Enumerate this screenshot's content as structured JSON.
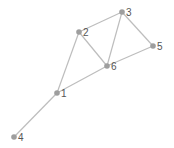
{
  "graph": {
    "colors": {
      "edge": "#bdbdbd",
      "node": "#9e9e9e",
      "label": "#555555",
      "background": "#ffffff"
    },
    "nodes": [
      {
        "id": "1",
        "label": "1",
        "x": 57,
        "y": 93
      },
      {
        "id": "2",
        "label": "2",
        "x": 79,
        "y": 32
      },
      {
        "id": "3",
        "label": "3",
        "x": 122,
        "y": 12
      },
      {
        "id": "4",
        "label": "4",
        "x": 14,
        "y": 137
      },
      {
        "id": "5",
        "label": "5",
        "x": 153,
        "y": 46
      },
      {
        "id": "6",
        "label": "6",
        "x": 107,
        "y": 66
      }
    ],
    "edges": [
      {
        "source": "1",
        "target": "4"
      },
      {
        "source": "1",
        "target": "2"
      },
      {
        "source": "1",
        "target": "6"
      },
      {
        "source": "2",
        "target": "3"
      },
      {
        "source": "2",
        "target": "6"
      },
      {
        "source": "3",
        "target": "6"
      },
      {
        "source": "3",
        "target": "5"
      },
      {
        "source": "5",
        "target": "6"
      }
    ]
  }
}
